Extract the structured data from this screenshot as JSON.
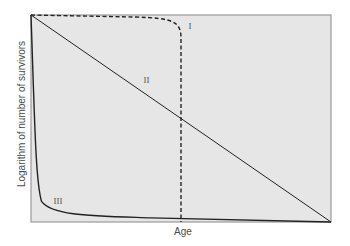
{
  "chart_data": {
    "type": "line",
    "title": "",
    "xlabel": "Age",
    "ylabel": "Logarithm of number of survivors",
    "grid": false,
    "legend": "none (curves labeled inline)",
    "xlim": [
      0,
      1
    ],
    "ylim": [
      0,
      1
    ],
    "series": [
      {
        "name": "I",
        "style": "dashed",
        "x": [
          0,
          0.2,
          0.4,
          0.45,
          0.49,
          0.5,
          0.5
        ],
        "y": [
          1.0,
          0.995,
          0.985,
          0.97,
          0.93,
          0.88,
          0.0
        ]
      },
      {
        "name": "II",
        "style": "solid",
        "x": [
          0,
          1
        ],
        "y": [
          1.0,
          0.0
        ]
      },
      {
        "name": "III",
        "style": "solid",
        "x": [
          0,
          0.01,
          0.02,
          0.04,
          0.08,
          0.15,
          0.3,
          0.6,
          1.0
        ],
        "y": [
          1.0,
          0.6,
          0.25,
          0.1,
          0.05,
          0.035,
          0.025,
          0.015,
          0.0
        ]
      }
    ],
    "annotations": [
      {
        "text": "I",
        "x": 0.535,
        "y": 0.94
      },
      {
        "text": "II",
        "x": 0.385,
        "y": 0.68
      },
      {
        "text": "III",
        "x": 0.085,
        "y": 0.095
      }
    ]
  },
  "labels": {
    "x_axis": "Age",
    "y_axis": "Logarithm of number of survivors",
    "curve_I": "I",
    "curve_II": "II",
    "curve_III": "III"
  },
  "colors": {
    "plot_background": "#e6e6e6",
    "frame": "#9a9a9a",
    "curve": "#222222",
    "text": "#4a4a4a"
  }
}
